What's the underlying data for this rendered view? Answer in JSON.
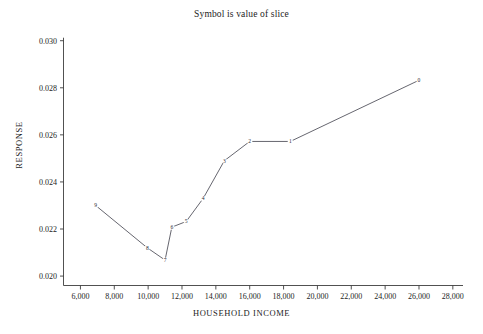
{
  "chart_data": {
    "type": "line",
    "title": "Symbol is value of slice",
    "xlabel": "HOUSEHOLD INCOME",
    "ylabel": "RESPONSE",
    "xlim": [
      5000,
      28600
    ],
    "ylim": [
      0.0196,
      0.0302
    ],
    "grid": false,
    "legend": "none",
    "xticks": [
      6000,
      8000,
      10000,
      12000,
      14000,
      16000,
      18000,
      20000,
      22000,
      24000,
      26000,
      28000
    ],
    "xticklabels": [
      "6,000",
      "8,000",
      "10,000",
      "12,000",
      "14,000",
      "16,000",
      "18,000",
      "20,000",
      "22,000",
      "24,000",
      "26,000",
      "28,000"
    ],
    "yticks": [
      0.02,
      0.022,
      0.024,
      0.026,
      0.028,
      0.03
    ],
    "yticklabels": [
      "0.020",
      "0.022",
      "0.024",
      "0.026",
      "0.028",
      "0.030"
    ],
    "series": [
      {
        "name": "slice",
        "marker_labels": [
          "9",
          "8",
          "7",
          "6",
          "5",
          "4",
          "3",
          "2",
          "1",
          "0"
        ],
        "x": [
          6900,
          9950,
          11000,
          11400,
          12250,
          13250,
          14500,
          16000,
          18400,
          26000
        ],
        "y": [
          0.023,
          0.0212,
          0.02068,
          0.02208,
          0.02232,
          0.0233,
          0.0249,
          0.02572,
          0.02572,
          0.02832
        ]
      }
    ]
  },
  "colors": {
    "axis": "#3d3d3d",
    "line": "#4a4a55",
    "text": "#1c1c1c",
    "background": "#ffffff"
  }
}
